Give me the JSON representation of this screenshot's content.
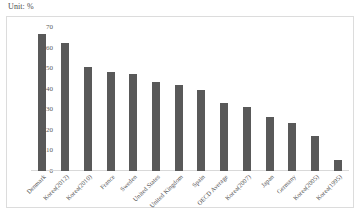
{
  "unit_label": "Unit: %",
  "chart_data": {
    "type": "bar",
    "title": "",
    "subtitle": "",
    "xlabel": "",
    "ylabel": "",
    "unit": "%",
    "ylim": [
      0,
      70
    ],
    "yticks": [
      0,
      10,
      20,
      30,
      40,
      50,
      60,
      70
    ],
    "ytick_labels": [
      "0",
      "10",
      "20",
      "30",
      "40",
      "50",
      "60",
      "70"
    ],
    "grid": false,
    "legend": "none",
    "bar_color": "#595959",
    "categories": [
      "Denmark",
      "Korea(2012)",
      "Korea(2010)",
      "France",
      "Sweden",
      "United States",
      "United Kingdom",
      "Spain",
      "OECD Average",
      "Korea(2007)",
      "Japan",
      "Germany",
      "Korea(2005)",
      "Korea(1995)"
    ],
    "values": [
      66.5,
      62,
      50.5,
      48,
      47,
      43.5,
      42,
      39.5,
      33,
      31,
      26.5,
      23.5,
      17,
      5.5
    ]
  }
}
